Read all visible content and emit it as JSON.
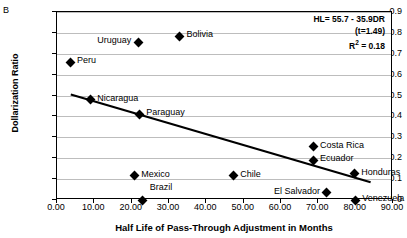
{
  "panel_label": "B",
  "chart_data": {
    "type": "scatter",
    "title": "",
    "xlabel": "Half Life of Pass-Through Adjustment in Months",
    "ylabel": "Dollarization Ratio",
    "xlim": [
      0,
      90
    ],
    "ylim": [
      0,
      0.9
    ],
    "xticks": [
      "0.00",
      "10.00",
      "20.00",
      "30.00",
      "40.00",
      "50.00",
      "60.00",
      "70.00",
      "80.00",
      "90.00"
    ],
    "xtick_values": [
      0,
      10,
      20,
      30,
      40,
      50,
      60,
      70,
      80,
      90
    ],
    "yticks": [
      "0",
      "0.1",
      "0.2",
      "0.3",
      "0.4",
      "0.5",
      "0.6",
      "0.7",
      "0.8",
      "0.9"
    ],
    "ytick_values": [
      0,
      0.1,
      0.2,
      0.3,
      0.4,
      0.5,
      0.6,
      0.7,
      0.8,
      0.9
    ],
    "grid": true,
    "legend": "none",
    "points": [
      {
        "label": "Peru",
        "x": 3.5,
        "y": 0.66,
        "label_side": "right"
      },
      {
        "label": "Uruguay",
        "x": 21.8,
        "y": 0.755,
        "label_side": "left"
      },
      {
        "label": "Bolivia",
        "x": 32.8,
        "y": 0.785,
        "label_side": "right"
      },
      {
        "label": "Nicaragua",
        "x": 8.9,
        "y": 0.48,
        "label_side": "right"
      },
      {
        "label": "Paraguay",
        "x": 22.0,
        "y": 0.41,
        "label_side": "right"
      },
      {
        "label": "Mexico",
        "x": 20.7,
        "y": 0.115,
        "label_side": "right"
      },
      {
        "label": "Chile",
        "x": 47.2,
        "y": 0.115,
        "label_side": "right"
      },
      {
        "label": "Costa Rica",
        "x": 68.6,
        "y": 0.255,
        "label_side": "right"
      },
      {
        "label": "Ecuador",
        "x": 68.6,
        "y": 0.19,
        "label_side": "right"
      },
      {
        "label": "Honduras",
        "x": 79.6,
        "y": 0.125,
        "label_side": "right"
      },
      {
        "label": "El Salvador",
        "x": 72.3,
        "y": 0.035,
        "label_side": "left"
      },
      {
        "label": "Venezuela",
        "x": 79.9,
        "y": 0.0,
        "label_side": "right"
      },
      {
        "label": "Brazil",
        "x": 23.0,
        "y": 0.0,
        "label_side": "left-above"
      }
    ],
    "trendline": {
      "x0": 3.7,
      "y0": 0.505,
      "x1": 84.0,
      "y1": 0.085
    },
    "annotations": {
      "equation_line1": "HL= 55.7 -  35.9DR",
      "equation_line2": "(t=1.49)",
      "r2_prefix": "R",
      "r2_sup": "2",
      "r2_value": " = 0.18"
    }
  }
}
